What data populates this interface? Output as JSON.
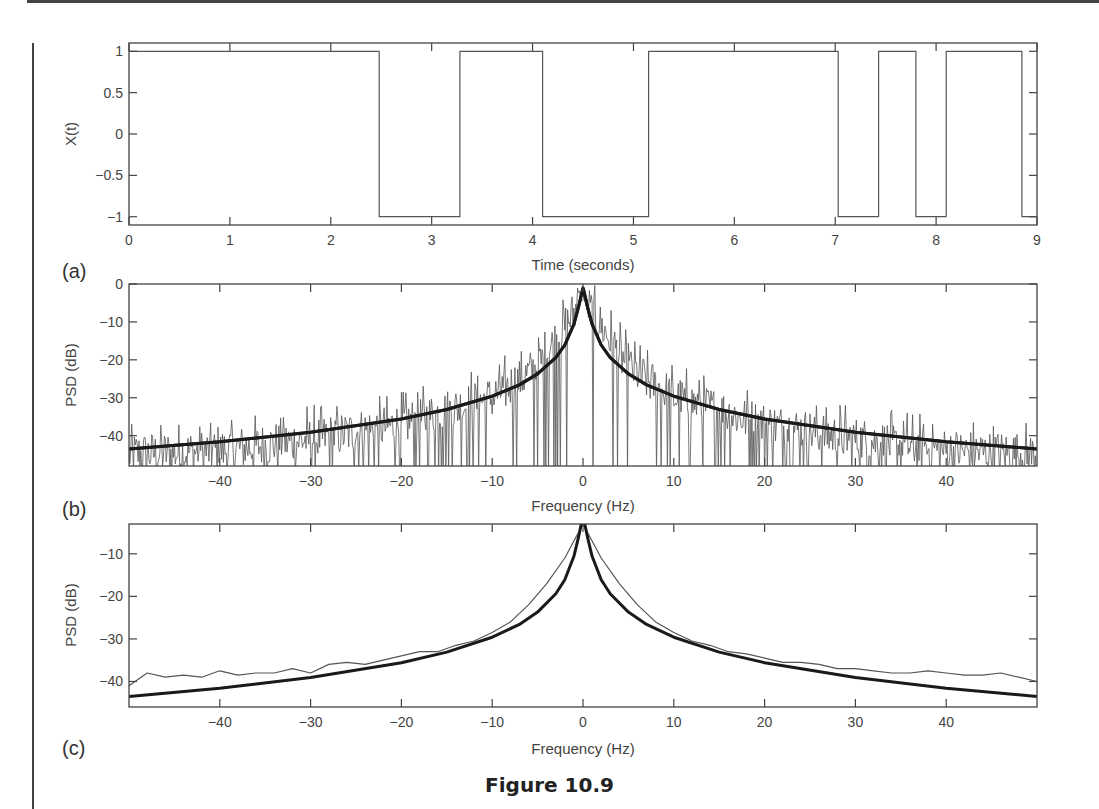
{
  "figure": {
    "caption": "Figure 10.9"
  },
  "panels": [
    {
      "id": "a",
      "label": "(a)",
      "xlabel": "Time (seconds)",
      "ylabel": "X(t)"
    },
    {
      "id": "b",
      "label": "(b)",
      "xlabel": "Frequency (Hz)",
      "ylabel": "PSD (dB)"
    },
    {
      "id": "c",
      "label": "(c)",
      "xlabel": "Frequency (Hz)",
      "ylabel": "PSD (dB)"
    }
  ],
  "chart_data": [
    {
      "type": "line",
      "panel": "(a)",
      "title": "",
      "xlabel": "Time (seconds)",
      "ylabel": "X(t)",
      "xlim": [
        0,
        9
      ],
      "ylim": [
        -1.1,
        1.1
      ],
      "xticks": [
        0,
        1,
        2,
        3,
        4,
        5,
        6,
        7,
        8,
        9
      ],
      "yticks": [
        1,
        0.5,
        0,
        -0.5,
        -1
      ],
      "ytick_labels": [
        "1",
        "0.5",
        "0",
        "−0.5",
        "−1"
      ],
      "grid": false,
      "series": [
        {
          "name": "random telegraph signal",
          "style": "step",
          "x": [
            0,
            2.48,
            2.48,
            3.28,
            3.28,
            4.1,
            4.1,
            5.15,
            5.15,
            7.03,
            7.03,
            7.43,
            7.43,
            7.8,
            7.8,
            8.1,
            8.1,
            8.85,
            8.85,
            9.0
          ],
          "y": [
            1,
            1,
            -1,
            -1,
            1,
            1,
            -1,
            -1,
            1,
            1,
            -1,
            -1,
            1,
            1,
            -1,
            -1,
            1,
            1,
            -1,
            -1
          ]
        }
      ]
    },
    {
      "type": "line",
      "panel": "(b)",
      "title": "",
      "xlabel": "Frequency (Hz)",
      "ylabel": "PSD (dB)",
      "xlim": [
        -50,
        50
      ],
      "ylim": [
        -48,
        0
      ],
      "xticks": [
        -40,
        -30,
        -20,
        -10,
        0,
        10,
        20,
        30,
        40
      ],
      "xtick_labels": [
        "−40",
        "−30",
        "−20",
        "−10",
        "0",
        "10",
        "20",
        "30",
        "40"
      ],
      "yticks": [
        0,
        -10,
        -20,
        -30,
        -40
      ],
      "ytick_labels": [
        "0",
        "−10",
        "−20",
        "−30",
        "−40"
      ],
      "grid": false,
      "series": [
        {
          "name": "periodogram estimate (noisy)",
          "style": "thin",
          "description": "highly fluctuating raw periodogram, spikes between approx -48 and -28 dB at |f|>20 Hz, peak near 0 dB at f=0",
          "envelope_x": [
            -50,
            -40,
            -30,
            -20,
            -10,
            -5,
            0,
            5,
            10,
            20,
            30,
            40,
            50
          ],
          "envelope_y_approx": [
            -41,
            -40,
            -37,
            -33,
            -26,
            -18,
            0,
            -18,
            -26,
            -33,
            -37,
            -40,
            -41
          ]
        },
        {
          "name": "theoretical PSD",
          "style": "thick",
          "x": [
            -50,
            -40,
            -30,
            -20,
            -15,
            -10,
            -7,
            -5,
            -3,
            -2,
            -1,
            -0.5,
            0,
            0.5,
            1,
            2,
            3,
            5,
            7,
            10,
            15,
            20,
            30,
            40,
            50
          ],
          "y": [
            -43.5,
            -41.6,
            -39.1,
            -35.6,
            -33.1,
            -29.6,
            -26.6,
            -23.7,
            -19.4,
            -16.1,
            -10.6,
            -6.1,
            -1.0,
            -6.1,
            -10.6,
            -16.1,
            -19.4,
            -23.7,
            -26.6,
            -29.6,
            -33.1,
            -35.6,
            -39.1,
            -41.6,
            -43.5
          ]
        }
      ]
    },
    {
      "type": "line",
      "panel": "(c)",
      "title": "",
      "xlabel": "Frequency (Hz)",
      "ylabel": "PSD (dB)",
      "xlim": [
        -50,
        50
      ],
      "ylim": [
        -46,
        -3
      ],
      "xticks": [
        -40,
        -30,
        -20,
        -10,
        0,
        10,
        20,
        30,
        40
      ],
      "xtick_labels": [
        "−40",
        "−30",
        "−20",
        "−10",
        "0",
        "10",
        "20",
        "30",
        "40"
      ],
      "yticks": [
        -10,
        -20,
        -30,
        -40
      ],
      "ytick_labels": [
        "−10",
        "−20",
        "−30",
        "−40"
      ],
      "grid": false,
      "series": [
        {
          "name": "averaged PSD estimate",
          "style": "thin",
          "x": [
            -50,
            -48,
            -46,
            -44,
            -42,
            -40,
            -38,
            -36,
            -34,
            -32,
            -30,
            -28,
            -26,
            -24,
            -22,
            -20,
            -18,
            -16,
            -14,
            -12,
            -10,
            -8,
            -6,
            -4,
            -2,
            0,
            2,
            4,
            6,
            8,
            10,
            12,
            14,
            16,
            18,
            20,
            22,
            24,
            26,
            28,
            30,
            32,
            34,
            36,
            38,
            40,
            42,
            44,
            46,
            48,
            50
          ],
          "y": [
            -41,
            -38,
            -39,
            -38.5,
            -39,
            -37.5,
            -38.5,
            -38,
            -38,
            -37,
            -38,
            -36,
            -35.5,
            -36,
            -35,
            -34,
            -33,
            -33,
            -31.5,
            -30.5,
            -28.5,
            -26,
            -22,
            -17,
            -11,
            -3,
            -11,
            -17,
            -22,
            -26,
            -28.5,
            -30.5,
            -31.5,
            -33,
            -33.5,
            -34.5,
            -35.5,
            -35.5,
            -36,
            -37,
            -37,
            -37.5,
            -38,
            -38,
            -37.5,
            -38,
            -38.5,
            -38.5,
            -38,
            -39,
            -40
          ]
        },
        {
          "name": "theoretical PSD",
          "style": "thick",
          "x": [
            -50,
            -40,
            -30,
            -20,
            -15,
            -10,
            -7,
            -5,
            -3,
            -2,
            -1,
            -0.5,
            0,
            0.5,
            1,
            2,
            3,
            5,
            7,
            10,
            15,
            20,
            30,
            40,
            50
          ],
          "y": [
            -43.5,
            -41.6,
            -39.1,
            -35.6,
            -33.1,
            -29.6,
            -26.6,
            -23.7,
            -19.4,
            -16.1,
            -10.6,
            -6.1,
            -1.0,
            -6.1,
            -10.6,
            -16.1,
            -19.4,
            -23.7,
            -26.6,
            -29.6,
            -33.1,
            -35.6,
            -39.1,
            -41.6,
            -43.5
          ]
        }
      ]
    }
  ]
}
